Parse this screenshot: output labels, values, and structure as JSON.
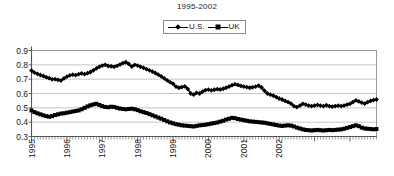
{
  "chart_data": {
    "type": "line",
    "title": "1995-2002",
    "xlabel": "",
    "ylabel": "",
    "ylim": [
      0.3,
      0.9
    ],
    "yticks": [
      "0.3",
      "0.4",
      "0.5",
      "0.6",
      "0.7",
      "0.8",
      "0.9"
    ],
    "ytick_values": [
      0.3,
      0.4,
      0.5,
      0.6,
      0.7,
      0.8,
      0.9
    ],
    "xticks": [
      "1995",
      "1996",
      "1997",
      "1998",
      "1999",
      "2000",
      "2001",
      "2002"
    ],
    "xtick_values": [
      1995,
      1996,
      1997,
      1998,
      1999,
      2000,
      2001,
      2002
    ],
    "xlim": [
      1995.0,
      2002.92
    ],
    "grid": "horizontal",
    "legend_position": "top-center",
    "series": [
      {
        "name": "U.S.",
        "marker": "diamond",
        "color": "#000000",
        "values": [
          0.76,
          0.745,
          0.737,
          0.729,
          0.722,
          0.714,
          0.707,
          0.699,
          0.7,
          0.695,
          0.69,
          0.705,
          0.718,
          0.726,
          0.731,
          0.728,
          0.735,
          0.74,
          0.735,
          0.742,
          0.75,
          0.762,
          0.775,
          0.786,
          0.795,
          0.8,
          0.792,
          0.79,
          0.786,
          0.793,
          0.802,
          0.812,
          0.818,
          0.806,
          0.788,
          0.8,
          0.795,
          0.786,
          0.779,
          0.77,
          0.762,
          0.753,
          0.743,
          0.731,
          0.72,
          0.706,
          0.692,
          0.679,
          0.668,
          0.648,
          0.64,
          0.645,
          0.65,
          0.632,
          0.6,
          0.592,
          0.605,
          0.6,
          0.613,
          0.624,
          0.627,
          0.622,
          0.626,
          0.63,
          0.628,
          0.633,
          0.64,
          0.648,
          0.658,
          0.665,
          0.66,
          0.653,
          0.648,
          0.645,
          0.64,
          0.643,
          0.648,
          0.655,
          0.642,
          0.62,
          0.6,
          0.592,
          0.585,
          0.575,
          0.565,
          0.558,
          0.548,
          0.54,
          0.53,
          0.512,
          0.505,
          0.515,
          0.528,
          0.522,
          0.516,
          0.512,
          0.516,
          0.52,
          0.516,
          0.512,
          0.518,
          0.512,
          0.508,
          0.512,
          0.516,
          0.512,
          0.516,
          0.522,
          0.528,
          0.54,
          0.552,
          0.545,
          0.536,
          0.53,
          0.54,
          0.548,
          0.554,
          0.558
        ]
      },
      {
        "name": "UK",
        "marker": "square",
        "color": "#000000",
        "values": [
          0.482,
          0.47,
          0.462,
          0.455,
          0.448,
          0.442,
          0.438,
          0.442,
          0.45,
          0.455,
          0.46,
          0.462,
          0.466,
          0.47,
          0.474,
          0.478,
          0.482,
          0.49,
          0.5,
          0.51,
          0.518,
          0.524,
          0.528,
          0.52,
          0.512,
          0.506,
          0.504,
          0.508,
          0.506,
          0.5,
          0.495,
          0.492,
          0.49,
          0.492,
          0.494,
          0.49,
          0.484,
          0.476,
          0.47,
          0.464,
          0.456,
          0.448,
          0.44,
          0.432,
          0.424,
          0.415,
          0.406,
          0.398,
          0.392,
          0.386,
          0.382,
          0.378,
          0.376,
          0.374,
          0.372,
          0.37,
          0.374,
          0.378,
          0.38,
          0.382,
          0.386,
          0.39,
          0.394,
          0.398,
          0.404,
          0.41,
          0.418,
          0.424,
          0.43,
          0.428,
          0.422,
          0.418,
          0.414,
          0.41,
          0.406,
          0.404,
          0.402,
          0.4,
          0.398,
          0.396,
          0.392,
          0.388,
          0.384,
          0.38,
          0.376,
          0.374,
          0.376,
          0.378,
          0.376,
          0.37,
          0.362,
          0.356,
          0.35,
          0.346,
          0.344,
          0.342,
          0.344,
          0.346,
          0.344,
          0.342,
          0.344,
          0.346,
          0.344,
          0.346,
          0.348,
          0.35,
          0.354,
          0.36,
          0.366,
          0.372,
          0.378,
          0.372,
          0.362,
          0.356,
          0.354,
          0.352,
          0.35,
          0.352
        ]
      }
    ]
  },
  "legend": {
    "items": [
      {
        "label": "U.S.",
        "marker": "diamond"
      },
      {
        "label": "UK",
        "marker": "square"
      }
    ]
  }
}
